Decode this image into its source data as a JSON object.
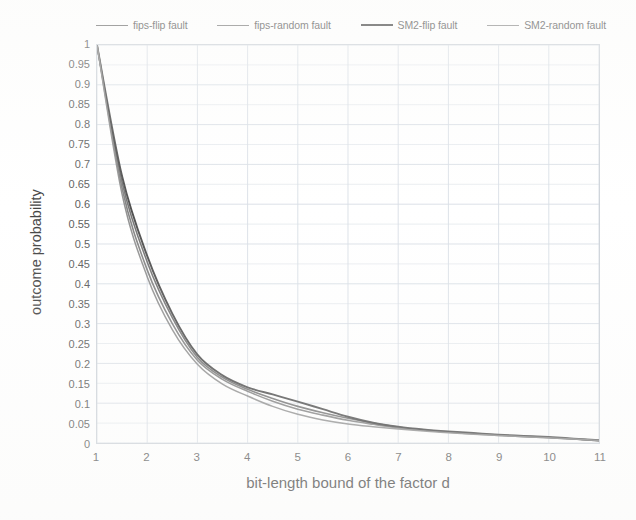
{
  "chart_data": {
    "type": "line",
    "title": "",
    "xlabel": "bit-length bound of the factor d",
    "ylabel": "outcome probability",
    "xlim": [
      1,
      11
    ],
    "ylim": [
      0,
      1
    ],
    "grid": true,
    "legend_position": "top",
    "x_ticks": [
      "1",
      "2",
      "3",
      "4",
      "5",
      "6",
      "7",
      "8",
      "9",
      "10",
      "11"
    ],
    "y_ticks": [
      "0",
      "0.05",
      "0.1",
      "0.15",
      "0.2",
      "0.25",
      "0.3",
      "0.35",
      "0.4",
      "0.45",
      "0.5",
      "0.55",
      "0.6",
      "0.65",
      "0.7",
      "0.75",
      "0.8",
      "0.85",
      "0.9",
      "0.95",
      "1"
    ],
    "x": [
      1,
      1.5,
      2,
      2.5,
      3,
      3.5,
      4,
      4.5,
      5,
      5.5,
      6,
      6.5,
      7,
      7.5,
      8,
      8.5,
      9,
      9.5,
      10,
      10.5,
      11
    ],
    "series": [
      {
        "name": "fips-flip fault",
        "color": "#5a5a5a",
        "width": 1.6,
        "values": [
          1.0,
          0.655,
          0.455,
          0.315,
          0.215,
          0.165,
          0.135,
          0.112,
          0.092,
          0.076,
          0.062,
          0.05,
          0.04,
          0.033,
          0.028,
          0.024,
          0.02,
          0.017,
          0.014,
          0.01,
          0.006
        ]
      },
      {
        "name": "fips-random fault",
        "color": "#6b6b6b",
        "width": 1.6,
        "values": [
          1.0,
          0.64,
          0.435,
          0.3,
          0.208,
          0.16,
          0.13,
          0.105,
          0.085,
          0.07,
          0.057,
          0.047,
          0.038,
          0.032,
          0.027,
          0.023,
          0.019,
          0.016,
          0.013,
          0.01,
          0.006
        ]
      },
      {
        "name": "SM2-flip fault",
        "color": "#2c2c2c",
        "width": 1.9,
        "values": [
          1.0,
          0.67,
          0.47,
          0.325,
          0.222,
          0.17,
          0.14,
          0.122,
          0.104,
          0.085,
          0.066,
          0.051,
          0.041,
          0.034,
          0.029,
          0.025,
          0.021,
          0.018,
          0.015,
          0.011,
          0.007
        ]
      },
      {
        "name": "SM2-random fault",
        "color": "#7d7d7d",
        "width": 1.5,
        "values": [
          1.0,
          0.625,
          0.418,
          0.285,
          0.198,
          0.148,
          0.118,
          0.092,
          0.072,
          0.058,
          0.048,
          0.041,
          0.035,
          0.03,
          0.026,
          0.022,
          0.019,
          0.016,
          0.013,
          0.01,
          0.006
        ]
      }
    ],
    "colors": {
      "grid": "#d3dae2",
      "axis_border": "#c9cfd6",
      "background": "#ffffff",
      "tick_text": "#4a4a4a",
      "title_text": "#2e2e2e"
    }
  }
}
